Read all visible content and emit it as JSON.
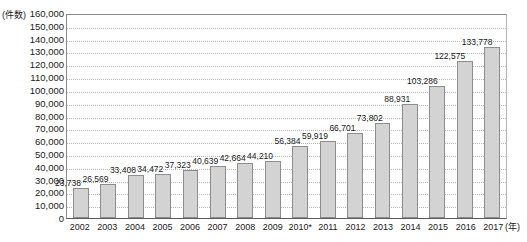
{
  "chart_data": {
    "type": "bar",
    "title": "",
    "subtitle": "",
    "xlabel": "(年)",
    "ylabel": "(件数)",
    "ylim": [
      0,
      160000
    ],
    "ytick_step": 10000,
    "grid": true,
    "legend": false,
    "legend_position": "none",
    "categories": [
      "2002",
      "2003",
      "2004",
      "2005",
      "2006",
      "2007",
      "2008",
      "2009",
      "2010*",
      "2011",
      "2012",
      "2013",
      "2014",
      "2015",
      "2016",
      "2017"
    ],
    "values": [
      23738,
      26569,
      33408,
      34472,
      37323,
      40639,
      42664,
      44210,
      56384,
      59919,
      66701,
      73802,
      88931,
      103286,
      122575,
      133778
    ],
    "value_labels": [
      "23,738",
      "26,569",
      "33,408",
      "34,472",
      "37,323",
      "40,639",
      "42,664",
      "44,210",
      "56,384",
      "59,919",
      "66,701",
      "73,802",
      "88,931",
      "103,286",
      "122,575",
      "133,778"
    ],
    "ytick_labels": [
      "160,000",
      "150,000",
      "140,000",
      "130,000",
      "120,000",
      "110,000",
      "100,000",
      "90,000",
      "80,000",
      "70,000",
      "60,000",
      "50,000",
      "40,000",
      "30,000",
      "20,000",
      "10,000",
      "0"
    ],
    "ytick_values": [
      160000,
      150000,
      140000,
      130000,
      120000,
      110000,
      100000,
      90000,
      80000,
      70000,
      60000,
      50000,
      40000,
      30000,
      20000,
      10000,
      0
    ],
    "annotations": [
      "* 2010年のデータには注記あり"
    ],
    "colors": {
      "bar_fill": "#d3d3d3",
      "bar_border": "#8d8d8d",
      "gridline": "#b9b9b9",
      "axis": "#5a5a5a",
      "text": "#1a1a1a"
    }
  },
  "axis": {
    "y_unit_caption": "(件数)",
    "x_unit_caption": "(年)"
  }
}
